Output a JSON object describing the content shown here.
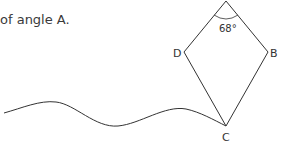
{
  "question": {
    "text": "of angle A."
  },
  "figure": {
    "shape": "kite",
    "vertices": {
      "A": {
        "label": "",
        "x": 226,
        "y": 1
      },
      "B": {
        "label": "B",
        "x": 268,
        "y": 52
      },
      "C": {
        "label": "C",
        "x": 226,
        "y": 126
      },
      "D": {
        "label": "D",
        "x": 184,
        "y": 52
      }
    },
    "angle_label": "68°",
    "line_color": "#333333",
    "wavy_line": "torn-edge"
  }
}
